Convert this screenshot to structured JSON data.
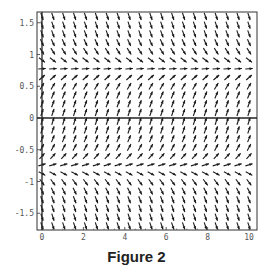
{
  "figure": {
    "caption": "Figure 2"
  },
  "chart_data": {
    "type": "vector_field",
    "title": "",
    "caption": "Figure 2",
    "xlabel": "",
    "ylabel": "",
    "equation_estimate": "dy/dx = cos(2y)",
    "xlim": [
      -0.2,
      10.2
    ],
    "ylim": [
      -1.75,
      1.65
    ],
    "xticks": [
      0,
      2,
      4,
      6,
      8,
      10
    ],
    "xtick_labels": [
      "0",
      "2",
      "4",
      "6",
      "8",
      "10"
    ],
    "yticks": [
      -1.5,
      -1,
      -0.5,
      0,
      0.5,
      1,
      1.5
    ],
    "ytick_labels": [
      "-1.5",
      "-1",
      "-0.5",
      "0",
      "0.5",
      "1",
      "1.5"
    ],
    "grid": false,
    "axis_line_y0": true,
    "equilibria_y": [
      0.785,
      -0.785
    ],
    "field_description": "Arrows point up-right between y=-0.785 and y=0.785; point down-right above 0.785 and below -0.785; horizontal near y=±0.785",
    "grid_columns": 20,
    "grid_rows": 25,
    "x_range_arrows": [
      0,
      10
    ],
    "y_range_arrows": [
      -1.7,
      1.6
    ],
    "colors": {
      "arrow": "#1a1a1a",
      "frame": "#333333",
      "axis": "#222222",
      "tick_label": "#555555"
    }
  }
}
